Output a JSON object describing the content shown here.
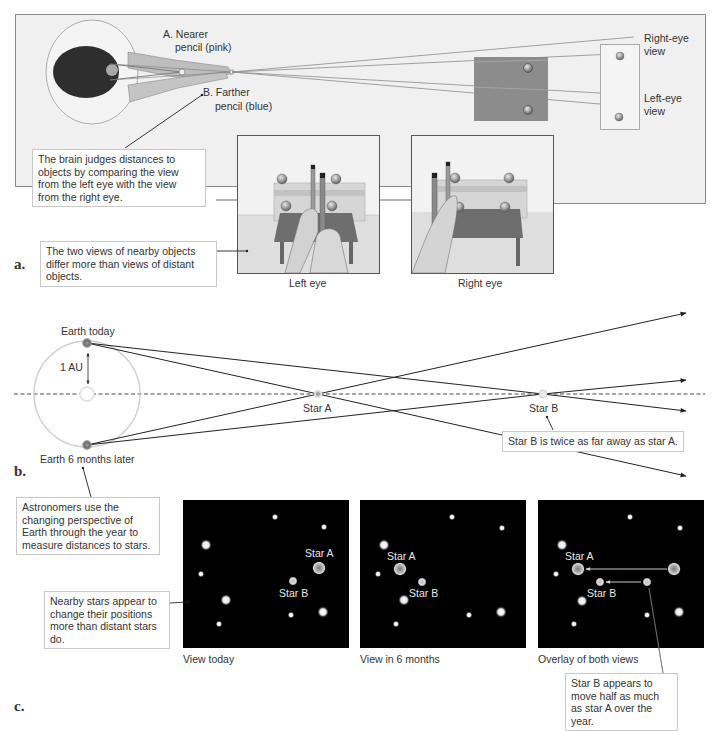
{
  "panel_a": {
    "letter": "a.",
    "label_nearer_line1": "A. Nearer",
    "label_nearer_line2": "pencil (pink)",
    "label_farther_line1": "B. Farther",
    "label_farther_line2": "pencil (blue)",
    "right_eye_view_line1": "Right-eye",
    "right_eye_view_line2": "view",
    "left_eye_view_line1": "Left-eye",
    "left_eye_view_line2": "view",
    "callout_brain": "The brain judges distances to objects by comparing the view from the left eye with the view from the right eye.",
    "callout_views": "The two views of nearby objects differ more than views of distant objects.",
    "caption_left_eye": "Left eye",
    "caption_right_eye": "Right eye"
  },
  "panel_b": {
    "letter": "b.",
    "earth_today": "Earth today",
    "earth_later": "Earth 6 months later",
    "au_label": "1 AU",
    "star_a": "Star A",
    "star_b": "Star B",
    "callout_distance": "Star B is twice as far away as star A.",
    "callout_astronomers": "Astronomers use the changing perspective of Earth through the year to measure distances to stars."
  },
  "panel_c": {
    "letter": "c.",
    "callout_nearby": "Nearby stars appear to change their positions more than distant stars do.",
    "view_today": {
      "caption": "View today",
      "star_a": "Star A",
      "star_b": "Star B"
    },
    "view_6_months": {
      "caption": "View in 6 months",
      "star_a": "Star A",
      "star_b": "Star B"
    },
    "overlay": {
      "caption": "Overlay of both views",
      "star_a": "Star A",
      "star_b": "Star B"
    },
    "callout_half": "Star B appears to move half as much as star A over the year."
  },
  "colors": {
    "panel_bg": "#f0f0f0",
    "panel_border": "#8a8a8a",
    "sky": "#000000",
    "line": "#222222",
    "orbit": "#cfcfcf",
    "backdrop_gray": "#8c8c8c"
  }
}
